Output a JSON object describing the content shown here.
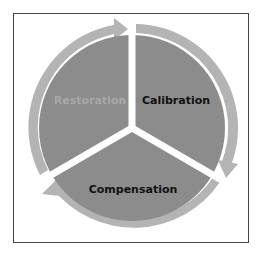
{
  "diagram": {
    "type": "cycle",
    "segments": [
      {
        "label": "Restoration",
        "text_color": "#a8a8a8"
      },
      {
        "label": "Calibration",
        "text_color": "#111111"
      },
      {
        "label": "Compensation",
        "text_color": "#111111"
      }
    ],
    "colors": {
      "segment_fill": "#8c8c8c",
      "ring_fill": "#b4b4b4",
      "divider": "#ffffff",
      "frame": "#444444"
    }
  }
}
